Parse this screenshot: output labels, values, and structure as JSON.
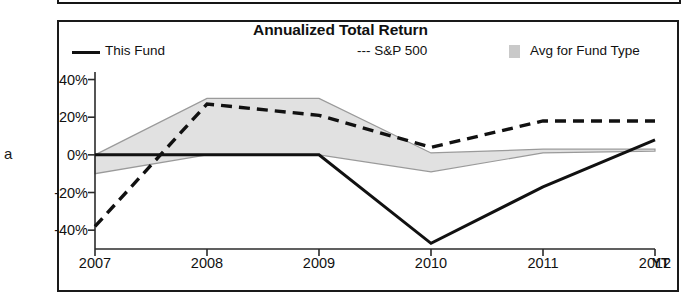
{
  "panel": {
    "title": "Annualized Total Return",
    "clipped_glyph": "a",
    "ytd_suffix": "YT"
  },
  "legend": {
    "items": [
      {
        "label": "This Fund",
        "marker": "solid-line",
        "color": "#111111"
      },
      {
        "label": "--- S&P 500",
        "marker": "dashed-line",
        "color": "#111111"
      },
      {
        "label": "Avg for Fund Type",
        "marker": "gray-band-swatch",
        "color": "#c9c9c9"
      }
    ]
  },
  "chart_data": {
    "type": "line",
    "title": "Annualized Total Return",
    "xlabel": "",
    "ylabel": "",
    "x": [
      "2007",
      "2008",
      "2009",
      "2010",
      "2011",
      "2012 YTD"
    ],
    "xtick_labels": [
      "2007",
      "2008",
      "2009",
      "2010",
      "2011",
      "2012"
    ],
    "ytick_labels": [
      "40%",
      "20%",
      "0%",
      "-20%",
      "-40%"
    ],
    "ytick_values": [
      40,
      20,
      0,
      -20,
      -40
    ],
    "ylim": [
      -50,
      44
    ],
    "grid": false,
    "legend_position": "top",
    "series": [
      {
        "name": "This Fund",
        "style": "solid",
        "color": "#111111",
        "values": [
          0,
          0,
          0,
          -47,
          -17,
          8
        ]
      },
      {
        "name": "S&P 500",
        "style": "dashed",
        "color": "#111111",
        "values": [
          -38,
          27,
          21,
          4,
          18,
          18
        ]
      },
      {
        "name": "Avg for Fund Type",
        "style": "band",
        "color": "#c9c9c9",
        "band_upper": [
          0,
          30,
          30,
          1,
          3,
          3
        ],
        "band_lower": [
          -10,
          0,
          0,
          -9,
          1,
          2
        ]
      }
    ]
  }
}
